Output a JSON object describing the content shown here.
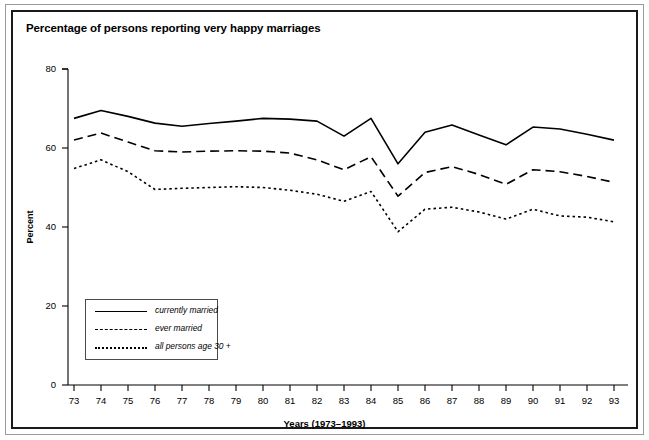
{
  "chart_title": "Percentage of persons reporting very happy marriages",
  "axes": {
    "ylabel": "Percent",
    "xlabel": "Years (1973–1993)",
    "yticks": [
      "0",
      "20",
      "40",
      "60",
      "80"
    ],
    "xticks": [
      "73",
      "74",
      "75",
      "76",
      "77",
      "78",
      "79",
      "80",
      "81",
      "82",
      "83",
      "84",
      "85",
      "86",
      "87",
      "88",
      "89",
      "90",
      "91",
      "92",
      "93"
    ]
  },
  "legend": {
    "items": [
      {
        "label": "currently married",
        "style": "solid"
      },
      {
        "label": "ever married",
        "style": "dashed"
      },
      {
        "label": "all persons age 30 +",
        "style": "dotted"
      }
    ]
  },
  "colors": {
    "line": "#000000",
    "frame": "#1a1a1a",
    "frame_outer": "#9a9a9a",
    "background": "#ffffff"
  },
  "chart_data": {
    "type": "line",
    "title": "Percentage of persons reporting very happy marriages",
    "xlabel": "Years (1973–1993)",
    "ylabel": "Percent",
    "xlim": [
      1973,
      1993
    ],
    "ylim": [
      0,
      80
    ],
    "grid": false,
    "legend_position": "lower-left",
    "x": [
      1973,
      1974,
      1975,
      1976,
      1977,
      1978,
      1979,
      1980,
      1981,
      1982,
      1983,
      1984,
      1985,
      1986,
      1987,
      1988,
      1989,
      1990,
      1991,
      1992,
      1993
    ],
    "xtick_labels": [
      "73",
      "74",
      "75",
      "76",
      "77",
      "78",
      "79",
      "80",
      "81",
      "82",
      "83",
      "84",
      "85",
      "86",
      "87",
      "88",
      "89",
      "90",
      "91",
      "92",
      "93"
    ],
    "series": [
      {
        "name": "currently married",
        "style": "solid",
        "values": [
          67.5,
          69.5,
          68.0,
          66.3,
          65.5,
          66.2,
          66.8,
          67.5,
          67.3,
          66.8,
          63.0,
          67.5,
          56.0,
          64.0,
          65.8,
          63.3,
          60.8,
          65.3,
          64.8,
          63.5,
          62.0
        ]
      },
      {
        "name": "ever married",
        "style": "dashed",
        "values": [
          62.0,
          63.8,
          61.5,
          59.3,
          59.0,
          59.2,
          59.3,
          59.2,
          58.7,
          57.0,
          54.5,
          57.8,
          47.8,
          53.8,
          55.3,
          53.3,
          50.8,
          54.5,
          54.0,
          52.8,
          51.3
        ]
      },
      {
        "name": "all persons age 30 +",
        "style": "dotted",
        "values": [
          54.8,
          57.0,
          54.0,
          49.5,
          49.8,
          50.0,
          50.2,
          50.0,
          49.3,
          48.3,
          46.5,
          49.0,
          38.8,
          44.5,
          45.0,
          43.8,
          42.0,
          44.5,
          42.8,
          42.5,
          41.3
        ]
      }
    ]
  }
}
